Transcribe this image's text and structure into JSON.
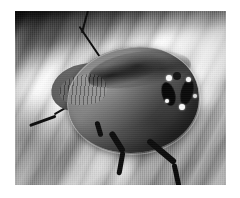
{
  "image": {
    "kind": "photograph",
    "subject": "shield-bug",
    "subject_label": "Shield bug (stink bug) nymph on plant surface",
    "color_mode": "grayscale",
    "orientation": "landscape",
    "border": {
      "present": true,
      "color": "#ffffff",
      "left": 15,
      "top": 11,
      "right": 14,
      "bottom": 13
    },
    "photo_area": {
      "x": 15,
      "y": 11,
      "width": 211,
      "height": 174
    },
    "palette": {
      "page_background": "#ffffff",
      "photo_midtone": "#9a9a9a",
      "background_light": "#efefef",
      "background_dark": "#4d4d4d",
      "insect_body": "#6a6a6a",
      "insect_shadow": "#3c3c3c",
      "marking_dark": "#0e0e0e",
      "highlight_spot": "#f2f2f2"
    },
    "background": {
      "description": "Diagonally ridged, striped plant stem or leaf surface",
      "stripe_angle_deg": 116,
      "shadow_band": "dark diagonal shadow across the top edge",
      "highlight_region": "bright stripes in the upper right"
    },
    "subject_parts": [
      {
        "name": "body",
        "description": "Rounded oval shield-shaped abdomen, mottled gray"
      },
      {
        "name": "head",
        "description": "Wedge-shaped head and pronotum at the left, finely ridged"
      },
      {
        "name": "antenna-upper",
        "description": "Thin dark antenna sweeping up and to the left"
      },
      {
        "name": "antenna-lower",
        "description": "Thin dark antenna sweeping down and to the left"
      },
      {
        "name": "markings",
        "description": "Dark spots with bright white highlights on the right flank"
      },
      {
        "name": "legs",
        "description": "Two dark jointed legs extending down from the body"
      }
    ]
  }
}
